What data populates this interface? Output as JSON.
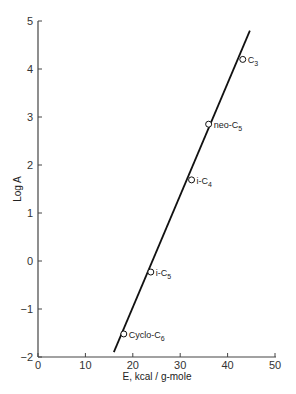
{
  "chart_data": {
    "type": "scatter",
    "title": "",
    "xlabel": "E, kcal / g-mole",
    "ylabel": "Log A",
    "xlim": [
      0,
      50
    ],
    "ylim": [
      -2,
      5
    ],
    "xticks": [
      0,
      10,
      20,
      30,
      40,
      50
    ],
    "yticks": [
      -2,
      -1,
      0,
      1,
      2,
      3,
      4,
      5
    ],
    "grid": false,
    "legend": null,
    "points": [
      {
        "label": "Cyclo-C6",
        "x": 18.1,
        "y": -1.52
      },
      {
        "label": "i-C5",
        "x": 23.8,
        "y": -0.23
      },
      {
        "label": "i-C4",
        "x": 32.4,
        "y": 1.69
      },
      {
        "label": "neo-C5",
        "x": 36.0,
        "y": 2.85
      },
      {
        "label": "C3",
        "x": 43.2,
        "y": 4.2
      }
    ],
    "fit_line": {
      "x": [
        16.0,
        44.7
      ],
      "y": [
        -1.9,
        4.8
      ]
    },
    "point_labels": [
      {
        "base": "Cyclo-C",
        "sub": "6"
      },
      {
        "base": "i-C",
        "sub": "5"
      },
      {
        "base": "i-C",
        "sub": "4"
      },
      {
        "base": "neo-C",
        "sub": "5"
      },
      {
        "base": "C",
        "sub": "3"
      }
    ]
  }
}
